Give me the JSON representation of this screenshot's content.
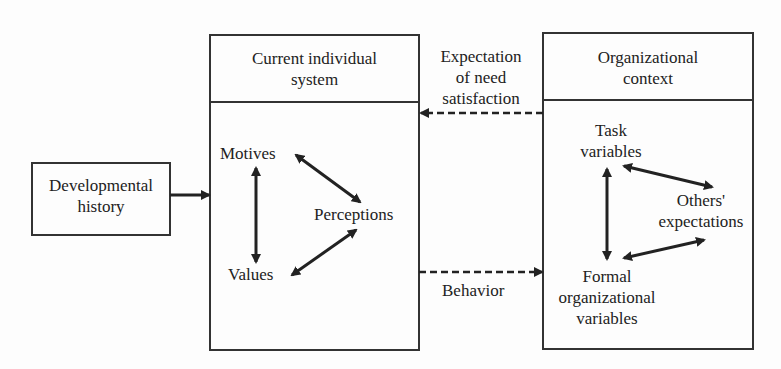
{
  "diagram": {
    "developmental": {
      "line1": "Developmental",
      "line2": "history"
    },
    "individual": {
      "title1": "Current individual",
      "title2": "system",
      "motives": "Motives",
      "perceptions": "Perceptions",
      "values": "Values"
    },
    "expectation": {
      "line1": "Expectation",
      "line2": "of need",
      "line3": "satisfaction"
    },
    "behavior": "Behavior",
    "organizational": {
      "title1": "Organizational",
      "title2": "context",
      "task1": "Task",
      "task2": "variables",
      "others1": "Others'",
      "others2": "expectations",
      "formal1": "Formal",
      "formal2": "organizational",
      "formal3": "variables"
    }
  }
}
